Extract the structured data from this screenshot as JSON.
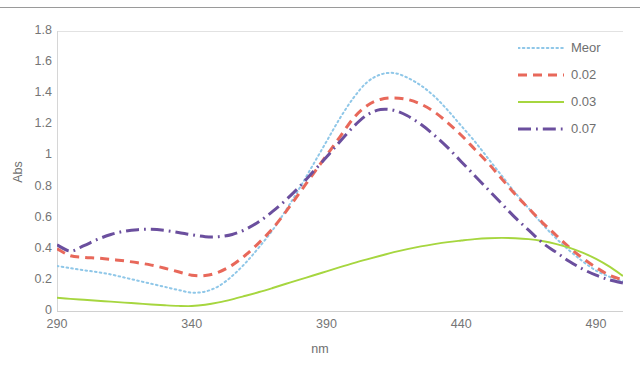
{
  "chart_data": {
    "type": "line",
    "title": "",
    "xlabel": "nm",
    "ylabel": "Abs",
    "xlim": [
      290,
      500
    ],
    "ylim": [
      0,
      1.8
    ],
    "xticks": [
      "290",
      "340",
      "390",
      "440",
      "490"
    ],
    "yticks": [
      "1.8",
      "1.6",
      "1.4",
      "1.2",
      "1",
      "0.8",
      "0.6",
      "0.4",
      "0.2",
      "0"
    ],
    "grid": false,
    "legend_position": "top-right",
    "x": [
      290,
      295,
      300,
      305,
      310,
      315,
      320,
      325,
      330,
      335,
      340,
      345,
      350,
      355,
      360,
      365,
      370,
      375,
      380,
      385,
      390,
      395,
      400,
      405,
      410,
      415,
      420,
      425,
      430,
      435,
      440,
      445,
      450,
      455,
      460,
      465,
      470,
      475,
      480,
      485,
      490,
      495,
      500
    ],
    "series": [
      {
        "name": "Meor",
        "color": "#8fc7e8",
        "style": "dotted",
        "values": [
          0.29,
          0.275,
          0.262,
          0.25,
          0.235,
          0.215,
          0.195,
          0.175,
          0.155,
          0.135,
          0.118,
          0.125,
          0.16,
          0.225,
          0.31,
          0.41,
          0.52,
          0.65,
          0.79,
          0.94,
          1.09,
          1.24,
          1.37,
          1.47,
          1.52,
          1.53,
          1.5,
          1.45,
          1.38,
          1.29,
          1.19,
          1.09,
          0.98,
          0.87,
          0.76,
          0.66,
          0.56,
          0.47,
          0.39,
          0.32,
          0.26,
          0.22,
          0.19
        ]
      },
      {
        "name": "0.02",
        "color": "#e8685a",
        "style": "dashed",
        "values": [
          0.4,
          0.355,
          0.345,
          0.34,
          0.332,
          0.322,
          0.31,
          0.295,
          0.275,
          0.252,
          0.23,
          0.228,
          0.25,
          0.295,
          0.36,
          0.44,
          0.53,
          0.64,
          0.76,
          0.88,
          1.0,
          1.12,
          1.24,
          1.32,
          1.36,
          1.37,
          1.36,
          1.33,
          1.28,
          1.21,
          1.13,
          1.04,
          0.95,
          0.85,
          0.75,
          0.66,
          0.57,
          0.49,
          0.41,
          0.34,
          0.28,
          0.23,
          0.2
        ]
      },
      {
        "name": "0.03",
        "color": "#a6d63f",
        "style": "solid",
        "values": [
          0.085,
          0.078,
          0.072,
          0.066,
          0.06,
          0.054,
          0.048,
          0.042,
          0.037,
          0.033,
          0.032,
          0.04,
          0.055,
          0.075,
          0.098,
          0.122,
          0.148,
          0.175,
          0.202,
          0.228,
          0.255,
          0.282,
          0.308,
          0.332,
          0.355,
          0.378,
          0.398,
          0.415,
          0.43,
          0.443,
          0.453,
          0.462,
          0.468,
          0.47,
          0.468,
          0.462,
          0.45,
          0.432,
          0.408,
          0.375,
          0.335,
          0.285,
          0.225
        ]
      },
      {
        "name": "0.07",
        "color": "#6b4f9e",
        "style": "dashdot",
        "values": [
          0.425,
          0.385,
          0.42,
          0.46,
          0.492,
          0.513,
          0.523,
          0.525,
          0.518,
          0.505,
          0.49,
          0.478,
          0.478,
          0.492,
          0.525,
          0.575,
          0.64,
          0.715,
          0.8,
          0.895,
          0.99,
          1.09,
          1.185,
          1.26,
          1.295,
          1.29,
          1.255,
          1.2,
          1.13,
          1.05,
          0.96,
          0.87,
          0.78,
          0.69,
          0.6,
          0.52,
          0.44,
          0.38,
          0.32,
          0.27,
          0.23,
          0.2,
          0.18
        ]
      }
    ]
  },
  "legend": {
    "items": [
      {
        "label": "Meor"
      },
      {
        "label": "0.02"
      },
      {
        "label": "0.03"
      },
      {
        "label": "0.07"
      }
    ]
  },
  "axes": {
    "x_title": "nm",
    "y_title": "Abs"
  }
}
